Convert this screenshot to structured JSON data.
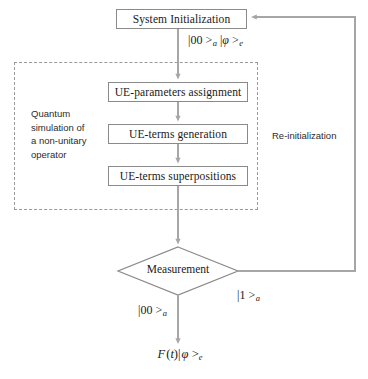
{
  "diagram": {
    "colors": {
      "box_border": "#8a8a8a",
      "wire": "#a6a6a6",
      "dashed_border": "#9a9a9a",
      "text": "#1a1a1a",
      "background": "#ffffff"
    },
    "nodes": {
      "system_initialization": "System Initialization",
      "ue_parameters_assignment": "UE-parameters assignment",
      "ue_terms_generation": "UE-terms generation",
      "ue_terms_superpositions": "UE-terms superpositions",
      "measurement": "Measurement"
    },
    "edge_labels": {
      "init_to_params": "|00 >a |φ >e",
      "measurement_zero_branch": "|00 >a",
      "measurement_one_branch": "|1 >a",
      "final_output": "F (t)| φ >e"
    },
    "annotations": {
      "dashed_group": "Quantum\nsimulation of\na non-unitary\noperator",
      "feedback_loop": "Re-initialization"
    }
  }
}
